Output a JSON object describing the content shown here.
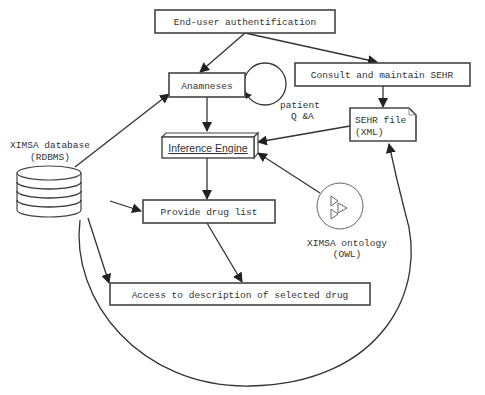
{
  "diagram": {
    "nodes": {
      "auth": {
        "label": "End-user authentification",
        "shape": "rectangle"
      },
      "anamneses": {
        "label": "Anamneses",
        "shape": "rectangle"
      },
      "patient_qa": {
        "label_line1": "patient",
        "label_line2": "Q &A",
        "shape": "loop-circle"
      },
      "consult_sehr": {
        "label": "Consult and maintain SEHR",
        "shape": "rectangle"
      },
      "sehr_file": {
        "label_line1": "SEHR file",
        "label_line2": "(XML)",
        "shape": "document"
      },
      "inference_engine": {
        "label": "Inference Engine",
        "shape": "3d-box"
      },
      "database": {
        "label_line1": "XIMSA database",
        "label_line2": "(RDBMS)",
        "shape": "cylinder"
      },
      "provide_drug_list": {
        "label": "Provide drug list",
        "shape": "rectangle"
      },
      "ontology": {
        "label_line1": "XIMSA ontology",
        "label_line2": "(OWL)",
        "shape": "circle-with-triangles"
      },
      "access_description": {
        "label": "Access to description of selected drug",
        "shape": "rectangle"
      }
    },
    "edges": [
      {
        "from": "auth",
        "to": "anamneses"
      },
      {
        "from": "auth",
        "to": "consult_sehr"
      },
      {
        "from": "anamneses",
        "to": "anamneses",
        "via": "patient_qa"
      },
      {
        "from": "anamneses",
        "to": "inference_engine"
      },
      {
        "from": "consult_sehr",
        "to": "sehr_file"
      },
      {
        "from": "sehr_file",
        "to": "inference_engine"
      },
      {
        "from": "ontology",
        "to": "inference_engine"
      },
      {
        "from": "database",
        "to": "anamneses"
      },
      {
        "from": "inference_engine",
        "to": "provide_drug_list"
      },
      {
        "from": "database",
        "to": "provide_drug_list"
      },
      {
        "from": "provide_drug_list",
        "to": "access_description"
      },
      {
        "from": "database",
        "to": "access_description"
      },
      {
        "from": "database",
        "to": "sehr_file",
        "style": "curved"
      }
    ]
  },
  "colors": {
    "stroke": "#333333",
    "background": "#ffffff",
    "text": "#333333"
  }
}
